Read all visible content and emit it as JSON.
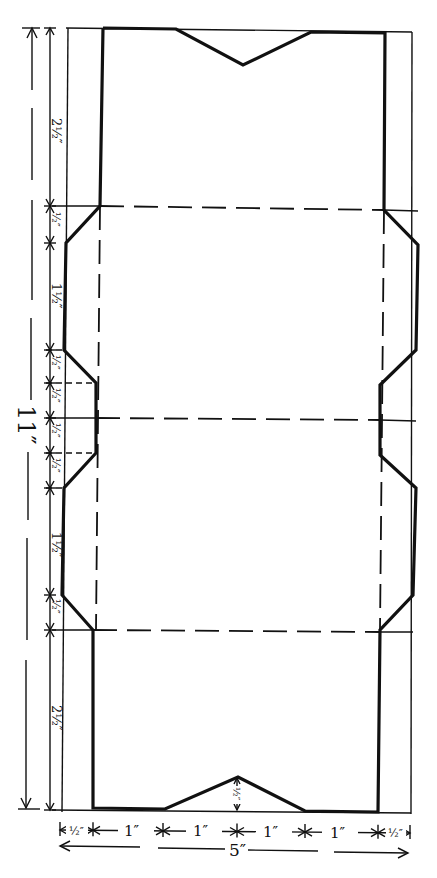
{
  "diagram": {
    "total_height_label": "11″",
    "total_width_label": "5″",
    "vertical_dimensions": [
      "2½″",
      "½″",
      "1½″",
      "½″",
      "½″",
      "½″",
      "½″",
      "1½″",
      "½″",
      "2½″"
    ],
    "horizontal_dimensions": [
      "½″",
      "1″",
      "1″",
      "1″",
      "1″",
      "½″"
    ],
    "notch_depth_label": "½″",
    "legend": {
      "cut_line": "solid thick",
      "fold_line": "dashed"
    }
  }
}
